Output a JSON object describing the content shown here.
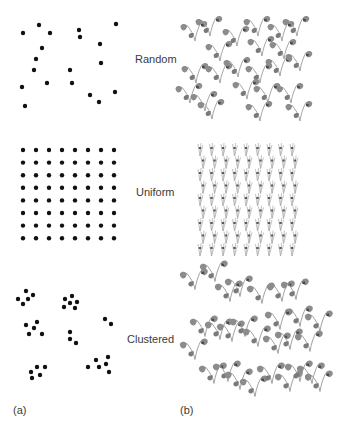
{
  "figure": {
    "panels": [
      {
        "id": "a",
        "label": "(a)",
        "title": "Dot patterns"
      },
      {
        "id": "b",
        "label": "(b)",
        "title": "Plant patterns"
      }
    ],
    "rows": [
      {
        "label": "Random"
      },
      {
        "label": "Uniform"
      },
      {
        "label": "Clustered"
      }
    ],
    "colors": {
      "dot": "#111111",
      "leaf": "#8c8c8c",
      "leaf_dark": "#6e6e6e",
      "stem": "#9a9a9a",
      "spot": "#4a4a4a",
      "text": "#3a3a3a"
    }
  },
  "dots": {
    "random": [
      [
        23,
        33
      ],
      [
        39,
        25
      ],
      [
        50,
        33
      ],
      [
        79,
        30
      ],
      [
        80,
        37
      ],
      [
        116,
        24
      ],
      [
        100,
        44
      ],
      [
        42,
        48
      ],
      [
        36,
        59
      ],
      [
        34,
        70
      ],
      [
        70,
        70
      ],
      [
        101,
        63
      ],
      [
        22,
        87
      ],
      [
        47,
        83
      ],
      [
        72,
        83
      ],
      [
        90,
        95
      ],
      [
        99,
        102
      ],
      [
        115,
        92
      ],
      [
        25,
        106
      ]
    ],
    "uniform": {
      "cols": 8,
      "rows": 8,
      "x0": 23,
      "dx": 13,
      "y0": 150,
      "dy": 12.6
    },
    "clustered": [
      [
        26,
        291
      ],
      [
        33,
        295
      ],
      [
        18,
        299
      ],
      [
        28,
        299
      ],
      [
        23,
        304
      ],
      [
        72,
        296
      ],
      [
        65,
        299
      ],
      [
        77,
        302
      ],
      [
        70,
        303
      ],
      [
        64,
        307
      ],
      [
        75,
        308
      ],
      [
        26,
        325
      ],
      [
        37,
        322
      ],
      [
        34,
        328
      ],
      [
        29,
        334
      ],
      [
        42,
        334
      ],
      [
        70,
        332
      ],
      [
        70,
        339
      ],
      [
        76,
        343
      ],
      [
        105,
        319
      ],
      [
        111,
        324
      ],
      [
        31,
        372
      ],
      [
        37,
        367
      ],
      [
        45,
        367
      ],
      [
        32,
        378
      ],
      [
        40,
        375
      ],
      [
        88,
        367
      ],
      [
        96,
        360
      ],
      [
        99,
        367
      ],
      [
        108,
        357
      ],
      [
        106,
        364
      ],
      [
        109,
        372
      ]
    ]
  },
  "plants": {
    "random": [
      [
        195,
        30
      ],
      [
        210,
        25
      ],
      [
        220,
        50
      ],
      [
        237,
        35
      ],
      [
        258,
        25
      ],
      [
        262,
        45
      ],
      [
        282,
        30
      ],
      [
        297,
        25
      ],
      [
        284,
        48
      ],
      [
        196,
        72
      ],
      [
        220,
        72
      ],
      [
        238,
        66
      ],
      [
        260,
        72
      ],
      [
        280,
        65
      ],
      [
        300,
        60
      ],
      [
        190,
        92
      ],
      [
        205,
        100
      ],
      [
        212,
        108
      ],
      [
        247,
        88
      ],
      [
        268,
        92
      ],
      [
        291,
        92
      ],
      [
        300,
        110
      ],
      [
        260,
        110
      ]
    ],
    "uniform": {
      "cols": 9,
      "rows": 9,
      "x0": 200,
      "dx": 11.5,
      "y0": 148,
      "dy": 12.5
    },
    "clustered": [
      [
        195,
        278
      ],
      [
        215,
        270
      ],
      [
        230,
        290
      ],
      [
        240,
        285
      ],
      [
        262,
        292
      ],
      [
        282,
        290
      ],
      [
        296,
        288
      ],
      [
        300,
        315
      ],
      [
        280,
        318
      ],
      [
        320,
        320
      ],
      [
        205,
        325
      ],
      [
        220,
        328
      ],
      [
        232,
        330
      ],
      [
        245,
        325
      ],
      [
        258,
        335
      ],
      [
        278,
        342
      ],
      [
        290,
        338
      ],
      [
        310,
        340
      ],
      [
        195,
        348
      ],
      [
        214,
        372
      ],
      [
        228,
        370
      ],
      [
        240,
        378
      ],
      [
        255,
        385
      ],
      [
        272,
        372
      ],
      [
        290,
        380
      ],
      [
        300,
        370
      ],
      [
        312,
        372
      ],
      [
        320,
        380
      ]
    ]
  }
}
